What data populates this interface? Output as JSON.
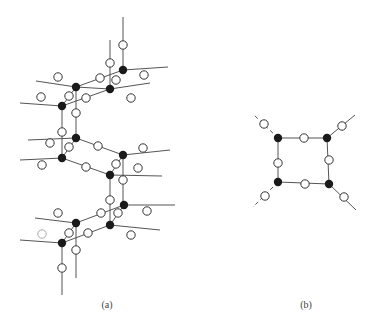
{
  "figure": {
    "colors": {
      "bond": "#555555",
      "filled_node": "#1a1a1a",
      "open_node_stroke": "#333333",
      "open_node_fill": "#ffffff",
      "faint_node_stroke": "#aaaaaa"
    },
    "node_radius": 4.2,
    "panels": [
      {
        "id": "a",
        "label": "(a)",
        "description": "Stacked 3D network of 4-connected centers (filled) bridged by linkers (open)",
        "bonds": [
          [
            123,
            17,
            123,
            70
          ],
          [
            110,
            40,
            110,
            89
          ],
          [
            123,
            70,
            168,
            67
          ],
          [
            110,
            89,
            150,
            83
          ],
          [
            76,
            87,
            123,
            70
          ],
          [
            62,
            106,
            110,
            89
          ],
          [
            36,
            81,
            76,
            87
          ],
          [
            20,
            103,
            62,
            106
          ],
          [
            76,
            87,
            76,
            137
          ],
          [
            62,
            106,
            62,
            158
          ],
          [
            110,
            89,
            76,
            87
          ],
          [
            76,
            87,
            62,
            106
          ],
          [
            28,
            140,
            76,
            138
          ],
          [
            20,
            160,
            62,
            158
          ],
          [
            76,
            138,
            123,
            155
          ],
          [
            62,
            158,
            110,
            175
          ],
          [
            76,
            138,
            62,
            158
          ],
          [
            123,
            155,
            110,
            175
          ],
          [
            123,
            155,
            170,
            150
          ],
          [
            110,
            175,
            162,
            176
          ],
          [
            123,
            155,
            123,
            205
          ],
          [
            110,
            175,
            110,
            225
          ],
          [
            124,
            205,
            175,
            205
          ],
          [
            110,
            225,
            160,
            230
          ],
          [
            76,
            223,
            124,
            205
          ],
          [
            62,
            243,
            110,
            225
          ],
          [
            35,
            218,
            76,
            223
          ],
          [
            20,
            240,
            62,
            243
          ],
          [
            76,
            223,
            62,
            243
          ],
          [
            124,
            205,
            110,
            225
          ],
          [
            76,
            223,
            76,
            278
          ],
          [
            62,
            243,
            62,
            295
          ]
        ],
        "filled_nodes": [
          [
            123,
            70
          ],
          [
            110,
            89
          ],
          [
            76,
            87
          ],
          [
            62,
            106
          ],
          [
            76,
            138
          ],
          [
            62,
            158
          ],
          [
            123,
            155
          ],
          [
            110,
            175
          ],
          [
            124,
            205
          ],
          [
            110,
            225
          ],
          [
            76,
            223
          ],
          [
            62,
            243
          ]
        ],
        "open_nodes": [
          [
            123,
            45
          ],
          [
            110,
            63
          ],
          [
            144,
            75
          ],
          [
            131,
            98
          ],
          [
            100,
            78
          ],
          [
            86,
            98
          ],
          [
            58,
            77
          ],
          [
            41,
            97
          ],
          [
            116,
            80
          ],
          [
            69,
            96
          ],
          [
            76,
            113
          ],
          [
            62,
            132
          ],
          [
            50,
            143
          ],
          [
            42,
            165
          ],
          [
            69,
            147
          ],
          [
            98,
            146
          ],
          [
            86,
            167
          ],
          [
            143,
            148
          ],
          [
            116,
            164
          ],
          [
            138,
            168
          ],
          [
            123,
            180
          ],
          [
            110,
            200
          ],
          [
            147,
            211
          ],
          [
            101,
            213
          ],
          [
            118,
            213
          ],
          [
            131,
            235
          ],
          [
            58,
            213
          ],
          [
            69,
            233
          ],
          [
            88,
            233
          ],
          [
            76,
            250
          ],
          [
            62,
            268
          ]
        ],
        "faint_nodes": [
          [
            42,
            234
          ]
        ]
      },
      {
        "id": "b",
        "label": "(b)",
        "description": "Single square unit of four filled centers bridged by open linkers with dashed outward bonds",
        "bonds": [
          [
            278,
            138,
            327,
            138
          ],
          [
            327,
            138,
            329,
            184
          ],
          [
            329,
            184,
            278,
            182
          ],
          [
            278,
            182,
            278,
            138
          ],
          [
            327,
            138,
            355,
            115
          ],
          [
            329,
            184,
            356,
            210
          ]
        ],
        "dashed_bonds": [
          [
            278,
            138,
            253,
            114
          ],
          [
            278,
            182,
            253,
            207
          ]
        ],
        "filled_nodes": [
          [
            278,
            138
          ],
          [
            327,
            138
          ],
          [
            329,
            184
          ],
          [
            278,
            182
          ]
        ],
        "open_nodes": [
          [
            304,
            138
          ],
          [
            278,
            163
          ],
          [
            329,
            160
          ],
          [
            305,
            184
          ],
          [
            264,
            124
          ],
          [
            342,
            126
          ],
          [
            265,
            196
          ],
          [
            344,
            197
          ]
        ],
        "faint_nodes": []
      }
    ]
  }
}
